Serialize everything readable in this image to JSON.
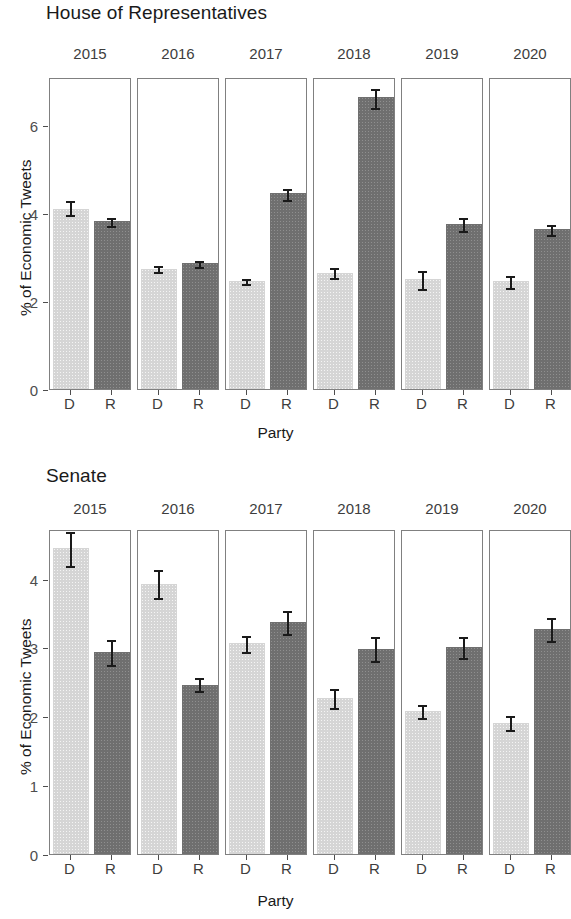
{
  "figure": {
    "x_axis_title": "Party",
    "y_axis_title": "% of Economic Tweets"
  },
  "panels": [
    {
      "id": "house",
      "title": "House of Representatives",
      "y_ticks": [
        "0",
        "2",
        "4",
        "6"
      ],
      "facets": [
        "2015",
        "2016",
        "2017",
        "2018",
        "2019",
        "2020"
      ],
      "x_ticks": [
        "D",
        "R"
      ]
    },
    {
      "id": "senate",
      "title": "Senate",
      "y_ticks": [
        "0",
        "1",
        "2",
        "3",
        "4"
      ],
      "facets": [
        "2015",
        "2016",
        "2017",
        "2018",
        "2019",
        "2020"
      ],
      "x_ticks": [
        "D",
        "R"
      ]
    }
  ],
  "chart_data": [
    {
      "type": "bar",
      "title": "House of Representatives",
      "xlabel": "Party",
      "ylabel": "% of Economic Tweets",
      "ylim": [
        0,
        7.1
      ],
      "yticks": [
        0,
        2,
        4,
        6
      ],
      "grid": false,
      "legend": "none",
      "facet_variable": "year",
      "categories": [
        "D",
        "R"
      ],
      "colors": {
        "D": "#d5d5d5",
        "R": "#6f6f6f"
      },
      "facets": [
        {
          "name": "2015",
          "values": [
            4.1,
            3.82
          ],
          "errors_low": [
            3.95,
            3.72
          ],
          "errors_high": [
            4.32,
            3.93
          ]
        },
        {
          "name": "2016",
          "values": [
            2.74,
            2.86
          ],
          "errors_low": [
            2.66,
            2.78
          ],
          "errors_high": [
            2.84,
            2.96
          ]
        },
        {
          "name": "2017",
          "values": [
            2.45,
            4.45
          ],
          "errors_low": [
            2.38,
            4.3
          ],
          "errors_high": [
            2.55,
            4.59
          ]
        },
        {
          "name": "2018",
          "values": [
            2.64,
            6.64
          ],
          "errors_low": [
            2.52,
            6.4
          ],
          "errors_high": [
            2.8,
            6.88
          ]
        },
        {
          "name": "2019",
          "values": [
            2.5,
            3.76
          ],
          "errors_low": [
            2.28,
            3.6
          ],
          "errors_high": [
            2.72,
            3.93
          ]
        },
        {
          "name": "2020",
          "values": [
            2.45,
            3.64
          ],
          "errors_low": [
            2.3,
            3.5
          ],
          "errors_high": [
            2.62,
            3.78
          ]
        }
      ]
    },
    {
      "type": "bar",
      "title": "Senate",
      "xlabel": "Party",
      "ylabel": "% of Economic Tweets",
      "ylim": [
        0,
        4.72
      ],
      "yticks": [
        0,
        1,
        2,
        3,
        4
      ],
      "grid": false,
      "legend": "none",
      "facet_variable": "year",
      "categories": [
        "D",
        "R"
      ],
      "colors": {
        "D": "#d5d5d5",
        "R": "#6f6f6f"
      },
      "facets": [
        {
          "name": "2015",
          "values": [
            4.44,
            2.93
          ],
          "errors_low": [
            4.18,
            2.74
          ],
          "errors_high": [
            4.7,
            3.13
          ]
        },
        {
          "name": "2016",
          "values": [
            3.92,
            2.45
          ],
          "errors_low": [
            3.72,
            2.37
          ],
          "errors_high": [
            4.16,
            2.58
          ]
        },
        {
          "name": "2017",
          "values": [
            3.07,
            3.37
          ],
          "errors_low": [
            2.94,
            3.2
          ],
          "errors_high": [
            3.2,
            3.56
          ]
        },
        {
          "name": "2018",
          "values": [
            2.26,
            2.98
          ],
          "errors_low": [
            2.12,
            2.8
          ],
          "errors_high": [
            2.42,
            3.18
          ]
        },
        {
          "name": "2019",
          "values": [
            2.08,
            3.0
          ],
          "errors_low": [
            1.98,
            2.84
          ],
          "errors_high": [
            2.2,
            3.18
          ]
        },
        {
          "name": "2020",
          "values": [
            1.9,
            3.27
          ],
          "errors_low": [
            1.8,
            3.1
          ],
          "errors_high": [
            2.03,
            3.46
          ]
        }
      ]
    }
  ]
}
